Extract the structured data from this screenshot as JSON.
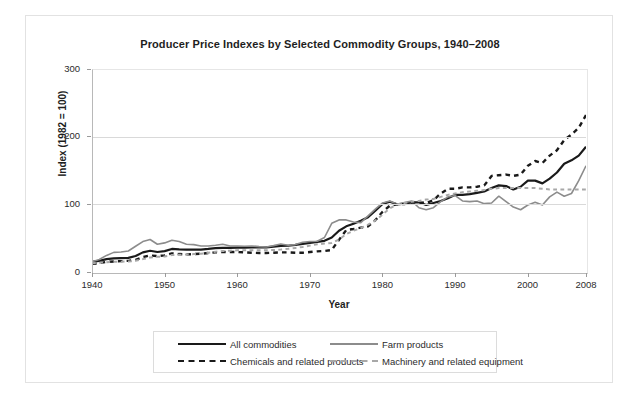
{
  "chart_data": {
    "type": "line",
    "title": "Producer Price Indexes by Selected Commodity Groups, 1940–2008",
    "xlabel": "Year",
    "ylabel": "Index (1982 = 100)",
    "xlim": [
      1940,
      2008
    ],
    "ylim": [
      0,
      300
    ],
    "yticks": [
      0,
      100,
      200,
      300
    ],
    "xticks": [
      1940,
      1950,
      1960,
      1970,
      1980,
      1990,
      2000,
      2008
    ],
    "grid": true,
    "legend_position": "bottom",
    "colors": {
      "all_commodities": "#1a1a1a",
      "farm_products": "#8c8c8c",
      "chemicals": "#1a1a1a",
      "machinery": "#a8a8a8",
      "gridline": "#d9d9d9",
      "axis": "#b8b8b8",
      "text": "#2b2b2b",
      "frame": "#e2e2e2"
    },
    "x": [
      1940,
      1941,
      1942,
      1943,
      1944,
      1945,
      1946,
      1947,
      1948,
      1949,
      1950,
      1951,
      1952,
      1953,
      1954,
      1955,
      1956,
      1957,
      1958,
      1959,
      1960,
      1961,
      1962,
      1963,
      1964,
      1965,
      1966,
      1967,
      1968,
      1969,
      1970,
      1971,
      1972,
      1973,
      1974,
      1975,
      1976,
      1977,
      1978,
      1979,
      1980,
      1981,
      1982,
      1983,
      1984,
      1985,
      1986,
      1987,
      1988,
      1989,
      1990,
      1991,
      1992,
      1993,
      1994,
      1995,
      1996,
      1997,
      1998,
      1999,
      2000,
      2001,
      2002,
      2003,
      2004,
      2005,
      2006,
      2007,
      2008
    ],
    "series": [
      {
        "name": "All commodities",
        "style": "solid",
        "color": "#1a1a1a",
        "width": 2.2,
        "values": [
          15.1,
          16.5,
          19.1,
          20.1,
          20.4,
          20.9,
          23.7,
          29.0,
          31.4,
          29.6,
          30.9,
          34.1,
          33.3,
          33.0,
          33.1,
          33.2,
          34.1,
          35.3,
          35.8,
          35.8,
          36.1,
          36.0,
          36.3,
          36.3,
          36.5,
          37.5,
          38.7,
          38.8,
          40.0,
          41.5,
          43.1,
          44.5,
          46.1,
          50.9,
          61.0,
          67.5,
          71.4,
          75.7,
          81.0,
          90.7,
          100.7,
          103.9,
          100.0,
          101.0,
          103.0,
          103.0,
          99.0,
          102.0,
          105.0,
          109.0,
          114.0,
          114.0,
          115.0,
          117.0,
          119.0,
          124.0,
          128.0,
          127.0,
          122.0,
          126.0,
          135.0,
          135.0,
          131.0,
          138.0,
          147.0,
          160.0,
          165.0,
          172.0,
          185.0
        ]
      },
      {
        "name": "Farm products",
        "style": "solid",
        "color": "#8c8c8c",
        "width": 1.6,
        "values": [
          15.0,
          18.5,
          24.5,
          29.0,
          29.5,
          31.0,
          38.0,
          45.0,
          48.0,
          41.0,
          43.0,
          47.0,
          45.0,
          41.0,
          40.5,
          38.5,
          38.5,
          39.5,
          41.0,
          38.5,
          38.5,
          38.0,
          38.5,
          37.5,
          37.0,
          39.0,
          41.5,
          39.5,
          40.5,
          44.0,
          45.0,
          45.5,
          51.0,
          72.0,
          77.0,
          77.0,
          74.0,
          73.0,
          83.0,
          93.0,
          102.0,
          105.0,
          100.0,
          102.5,
          105.0,
          95.0,
          92.0,
          95.0,
          104.0,
          111.0,
          113.0,
          105.0,
          104.0,
          105.0,
          101.0,
          102.0,
          112.0,
          104.0,
          96.0,
          92.0,
          99.0,
          103.0,
          99.0,
          111.0,
          118.0,
          112.0,
          116.0,
          135.0,
          157.0
        ]
      },
      {
        "name": "Chemicals and related products",
        "style": "dashed",
        "color": "#1a1a1a",
        "width": 2.4,
        "values": [
          12.0,
          13.0,
          15.0,
          15.5,
          16.0,
          16.5,
          18.0,
          22.0,
          24.5,
          23.5,
          24.5,
          27.5,
          26.5,
          26.0,
          26.5,
          27.0,
          28.0,
          29.0,
          29.5,
          29.5,
          29.5,
          29.0,
          28.5,
          28.0,
          28.0,
          28.5,
          29.0,
          29.0,
          28.5,
          28.5,
          29.5,
          30.5,
          31.0,
          32.5,
          47.5,
          62.0,
          63.5,
          65.5,
          67.5,
          76.5,
          89.0,
          98.0,
          100.0,
          100.5,
          102.5,
          103.0,
          102.0,
          106.0,
          116.0,
          123.0,
          123.0,
          125.0,
          125.0,
          126.0,
          128.0,
          142.0,
          143.0,
          144.0,
          142.0,
          144.0,
          157.0,
          164.0,
          161.0,
          172.0,
          180.0,
          195.0,
          203.0,
          213.0,
          232.0
        ]
      },
      {
        "name": "Machinery and related equipment",
        "style": "dashed",
        "color": "#a8a8a8",
        "width": 2.0,
        "values": [
          13.0,
          13.5,
          14.5,
          15.0,
          15.2,
          15.5,
          16.5,
          19.0,
          21.5,
          22.5,
          23.0,
          25.0,
          25.5,
          26.0,
          26.5,
          27.0,
          28.5,
          30.0,
          31.0,
          31.5,
          32.0,
          32.0,
          32.0,
          32.0,
          32.2,
          32.5,
          33.2,
          34.2,
          35.5,
          37.0,
          39.0,
          41.0,
          42.0,
          43.0,
          48.0,
          56.0,
          61.0,
          65.0,
          70.0,
          76.0,
          85.0,
          94.0,
          100.0,
          102.0,
          104.0,
          105.0,
          107.0,
          108.0,
          111.0,
          114.0,
          116.0,
          118.0,
          119.0,
          120.0,
          121.0,
          123.0,
          124.0,
          124.0,
          124.0,
          124.0,
          124.0,
          124.0,
          123.0,
          122.0,
          122.0,
          122.0,
          122.0,
          122.0,
          122.0
        ]
      }
    ]
  },
  "axes": {
    "y_tick_labels": [
      "300",
      "200",
      "100",
      "0"
    ],
    "x_tick_labels": [
      "1940",
      "1950",
      "1960",
      "1970",
      "1980",
      "1990",
      "2000",
      "2008"
    ],
    "y_title": "Index (1982 = 100)",
    "x_title": "Year"
  },
  "legend": {
    "entries": [
      {
        "label": "All commodities",
        "style": "solid",
        "color": "#1a1a1a"
      },
      {
        "label": "Farm products",
        "style": "solid",
        "color": "#8c8c8c"
      },
      {
        "label": "Chemicals and related products",
        "style": "dashed",
        "color": "#1a1a1a"
      },
      {
        "label": "Machinery and related equipment",
        "style": "dashed",
        "color": "#a8a8a8"
      }
    ]
  }
}
